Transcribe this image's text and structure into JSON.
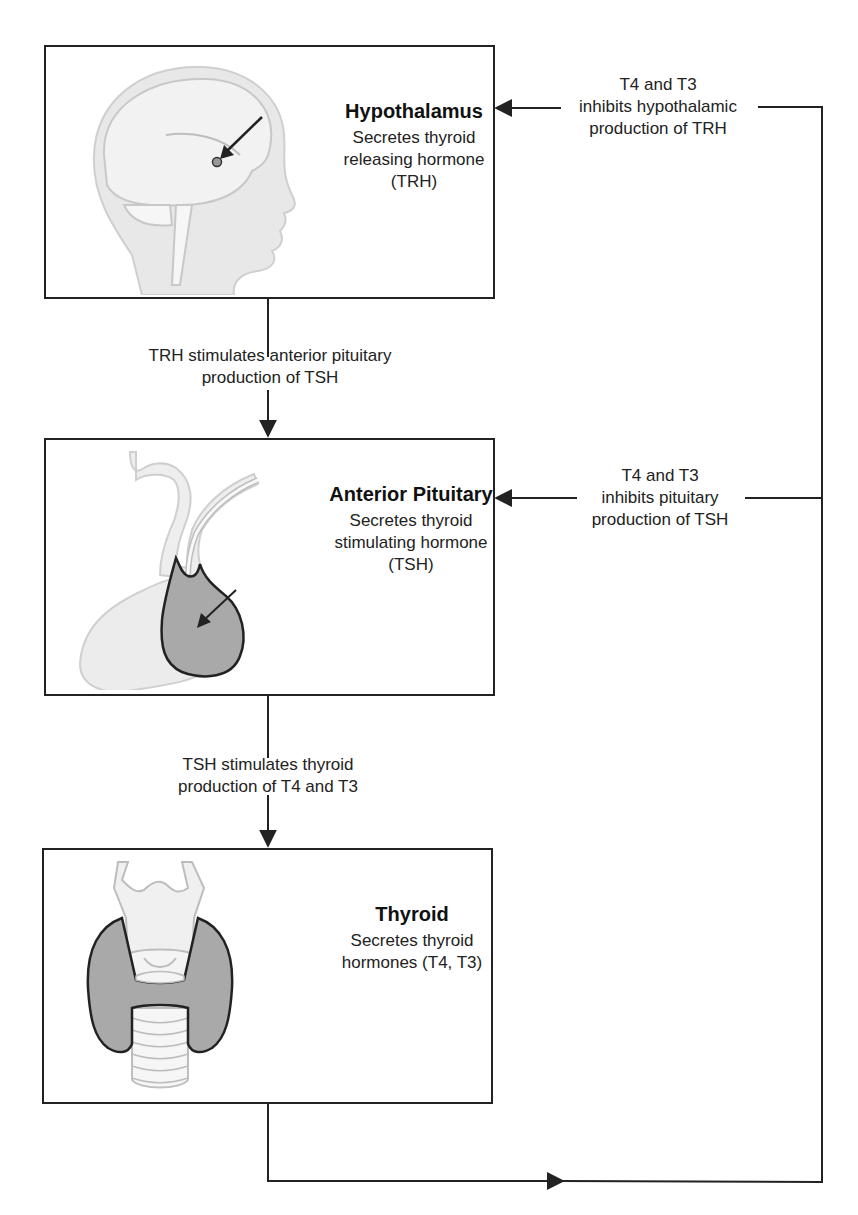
{
  "diagram": {
    "colors": {
      "line": "#222222",
      "box_border": "#222222",
      "illustration_light": "#e6e6e6",
      "illustration_dark": "#a6a6a6",
      "text": "#222222"
    },
    "nodes": [
      {
        "id": "hypothalamus",
        "title": "Hypothalamus",
        "desc_lines": [
          "Secretes thyroid",
          "releasing hormone",
          "(TRH)"
        ],
        "illustration": "head-profile-icon"
      },
      {
        "id": "anterior-pituitary",
        "title": "Anterior Pituitary",
        "desc_lines": [
          "Secretes thyroid",
          "stimulating hormone",
          "(TSH)"
        ],
        "illustration": "pituitary-gland-icon"
      },
      {
        "id": "thyroid",
        "title": "Thyroid",
        "desc_lines": [
          "Secretes thyroid",
          "hormones (T4, T3)"
        ],
        "illustration": "thyroid-gland-icon"
      }
    ],
    "edges": [
      {
        "id": "trh-to-pituitary",
        "from": "hypothalamus",
        "to": "anterior-pituitary",
        "type": "stimulates",
        "label_lines": [
          "TRH stimulates anterior pituitary",
          "production of TSH"
        ]
      },
      {
        "id": "tsh-to-thyroid",
        "from": "anterior-pituitary",
        "to": "thyroid",
        "type": "stimulates",
        "label_lines": [
          "TSH stimulates thyroid",
          "production of T4 and T3"
        ]
      },
      {
        "id": "feedback-to-hypothalamus",
        "from": "thyroid",
        "to": "hypothalamus",
        "type": "inhibits",
        "label_lines": [
          "T4 and T3",
          "inhibits hypothalamic",
          "production of TRH"
        ]
      },
      {
        "id": "feedback-to-pituitary",
        "from": "thyroid",
        "to": "anterior-pituitary",
        "type": "inhibits",
        "label_lines": [
          "T4 and T3",
          "inhibits pituitary",
          "production of TSH"
        ]
      }
    ]
  }
}
